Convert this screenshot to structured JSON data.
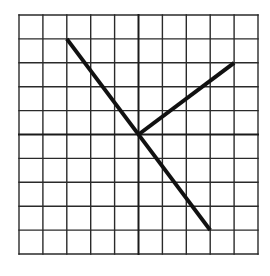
{
  "diagram": {
    "type": "grid-with-lines",
    "grid": {
      "columns": 10,
      "rows": 10,
      "origin_px": [
        19,
        15
      ],
      "cell_px": 23.9,
      "line_color": "#2a2a2a",
      "axis_color": "#1a1a1a"
    },
    "axes": {
      "center_col": 5,
      "center_row": 5
    },
    "segments": [
      {
        "name": "long-diagonal-line",
        "from": [
          2,
          1
        ],
        "to": [
          8,
          9
        ],
        "color": "#111111",
        "width": 4
      },
      {
        "name": "short-diagonal-line",
        "from": [
          5,
          5
        ],
        "to": [
          9,
          2
        ],
        "color": "#111111",
        "width": 4
      }
    ]
  }
}
